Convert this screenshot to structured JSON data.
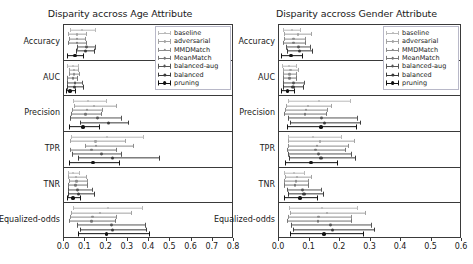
{
  "chart_data": {
    "type": "scatter",
    "layout": "2 panels side by side, each with 6 stacked metric sub-rows; horizontal point estimates with confidence-interval error bars",
    "panels": [
      {
        "id": "age",
        "title": "Disparity accross Age Attribute",
        "xlabel": "",
        "ylabel": "",
        "xlim": [
          0.0,
          0.8
        ],
        "xticks": [
          "0.0",
          "0.1",
          "0.2",
          "0.3",
          "0.4",
          "0.5",
          "0.6",
          "0.7",
          "0.8"
        ],
        "grid": false,
        "legend_position": "upper right",
        "metrics": [
          {
            "label": "Accuracy",
            "series": [
              {
                "name": "baseline",
                "value": 0.085,
                "low": 0.03,
                "high": 0.15
              },
              {
                "name": "adversarial",
                "value": 0.06,
                "low": 0.018,
                "high": 0.11
              },
              {
                "name": "MMDMatch",
                "value": 0.06,
                "low": 0.022,
                "high": 0.105
              },
              {
                "name": "MeanMatch",
                "value": 0.062,
                "low": 0.02,
                "high": 0.108
              },
              {
                "name": "balanced-aug",
                "value": 0.108,
                "low": 0.062,
                "high": 0.152
              },
              {
                "name": "balanced",
                "value": 0.103,
                "low": 0.058,
                "high": 0.148
              },
              {
                "name": "pruning",
                "value": 0.052,
                "low": 0.012,
                "high": 0.095
              }
            ]
          },
          {
            "label": "AUC",
            "series": [
              {
                "name": "baseline",
                "value": 0.04,
                "low": 0.015,
                "high": 0.07
              },
              {
                "name": "adversarial",
                "value": 0.046,
                "low": 0.022,
                "high": 0.072
              },
              {
                "name": "MMDMatch",
                "value": 0.048,
                "low": 0.024,
                "high": 0.074
              },
              {
                "name": "MeanMatch",
                "value": 0.042,
                "low": 0.016,
                "high": 0.068
              },
              {
                "name": "balanced-aug",
                "value": 0.052,
                "low": 0.014,
                "high": 0.09
              },
              {
                "name": "balanced",
                "value": 0.05,
                "low": 0.012,
                "high": 0.092
              },
              {
                "name": "pruning",
                "value": 0.03,
                "low": 0.01,
                "high": 0.058
              }
            ]
          },
          {
            "label": "Precision",
            "series": [
              {
                "name": "baseline",
                "value": 0.115,
                "low": 0.04,
                "high": 0.2
              },
              {
                "name": "adversarial",
                "value": 0.14,
                "low": 0.048,
                "high": 0.248
              },
              {
                "name": "MMDMatch",
                "value": 0.108,
                "low": 0.038,
                "high": 0.185
              },
              {
                "name": "MeanMatch",
                "value": 0.1,
                "low": 0.035,
                "high": 0.178
              },
              {
                "name": "balanced-aug",
                "value": 0.158,
                "low": 0.03,
                "high": 0.275
              },
              {
                "name": "balanced",
                "value": 0.208,
                "low": 0.075,
                "high": 0.305
              },
              {
                "name": "pruning",
                "value": 0.09,
                "low": 0.022,
                "high": 0.17
              }
            ]
          },
          {
            "label": "TPR",
            "series": [
              {
                "name": "baseline",
                "value": 0.2,
                "low": 0.035,
                "high": 0.375
              },
              {
                "name": "adversarial",
                "value": 0.148,
                "low": 0.03,
                "high": 0.29
              },
              {
                "name": "MMDMatch",
                "value": 0.15,
                "low": 0.1,
                "high": 0.33
              },
              {
                "name": "MeanMatch",
                "value": 0.13,
                "low": 0.028,
                "high": 0.25
              },
              {
                "name": "balanced-aug",
                "value": 0.178,
                "low": 0.038,
                "high": 0.272
              },
              {
                "name": "balanced",
                "value": 0.228,
                "low": 0.068,
                "high": 0.45
              },
              {
                "name": "pruning",
                "value": 0.135,
                "low": 0.025,
                "high": 0.262
              }
            ]
          },
          {
            "label": "TNR",
            "series": [
              {
                "name": "baseline",
                "value": 0.042,
                "low": 0.018,
                "high": 0.075
              },
              {
                "name": "adversarial",
                "value": 0.055,
                "low": 0.02,
                "high": 0.11
              },
              {
                "name": "MMDMatch",
                "value": 0.058,
                "low": 0.022,
                "high": 0.115
              },
              {
                "name": "MeanMatch",
                "value": 0.055,
                "low": 0.02,
                "high": 0.112
              },
              {
                "name": "balanced-aug",
                "value": 0.062,
                "low": 0.018,
                "high": 0.135
              },
              {
                "name": "balanced",
                "value": 0.07,
                "low": 0.02,
                "high": 0.148
              },
              {
                "name": "pruning",
                "value": 0.042,
                "low": 0.015,
                "high": 0.082
              }
            ]
          },
          {
            "label": "Equalized-odds",
            "series": [
              {
                "name": "baseline",
                "value": 0.205,
                "low": 0.04,
                "high": 0.37
              },
              {
                "name": "adversarial",
                "value": 0.17,
                "low": 0.032,
                "high": 0.318
              },
              {
                "name": "MMDMatch",
                "value": 0.135,
                "low": 0.028,
                "high": 0.25
              },
              {
                "name": "MeanMatch",
                "value": 0.13,
                "low": 0.025,
                "high": 0.245
              },
              {
                "name": "balanced-aug",
                "value": 0.222,
                "low": 0.06,
                "high": 0.385
              },
              {
                "name": "balanced",
                "value": 0.23,
                "low": 0.075,
                "high": 0.392
              },
              {
                "name": "pruning",
                "value": 0.2,
                "low": 0.068,
                "high": 0.405
              }
            ]
          }
        ]
      },
      {
        "id": "gender",
        "title": "Disparity accross Gender Attribute",
        "xlabel": "",
        "ylabel": "",
        "xlim": [
          0.0,
          0.6
        ],
        "xticks": [
          "0.0",
          "0.1",
          "0.2",
          "0.3",
          "0.4",
          "0.5",
          "0.6"
        ],
        "grid": false,
        "legend_position": "upper right",
        "metrics": [
          {
            "label": "Accuracy",
            "series": [
              {
                "name": "baseline",
                "value": 0.042,
                "low": 0.012,
                "high": 0.072
              },
              {
                "name": "adversarial",
                "value": 0.062,
                "low": 0.018,
                "high": 0.108
              },
              {
                "name": "MMDMatch",
                "value": 0.048,
                "low": 0.015,
                "high": 0.09
              },
              {
                "name": "MeanMatch",
                "value": 0.048,
                "low": 0.014,
                "high": 0.088
              },
              {
                "name": "balanced-aug",
                "value": 0.065,
                "low": 0.022,
                "high": 0.105
              },
              {
                "name": "balanced",
                "value": 0.068,
                "low": 0.025,
                "high": 0.11
              },
              {
                "name": "pruning",
                "value": 0.04,
                "low": 0.008,
                "high": 0.078
              }
            ]
          },
          {
            "label": "AUC",
            "series": [
              {
                "name": "baseline",
                "value": 0.032,
                "low": 0.01,
                "high": 0.058
              },
              {
                "name": "adversarial",
                "value": 0.038,
                "low": 0.014,
                "high": 0.065
              },
              {
                "name": "MMDMatch",
                "value": 0.035,
                "low": 0.012,
                "high": 0.06
              },
              {
                "name": "MeanMatch",
                "value": 0.034,
                "low": 0.012,
                "high": 0.058
              },
              {
                "name": "balanced-aug",
                "value": 0.048,
                "low": 0.012,
                "high": 0.085
              },
              {
                "name": "balanced",
                "value": 0.046,
                "low": 0.012,
                "high": 0.082
              },
              {
                "name": "pruning",
                "value": 0.028,
                "low": 0.008,
                "high": 0.052
              }
            ]
          },
          {
            "label": "Precision",
            "series": [
              {
                "name": "baseline",
                "value": 0.13,
                "low": 0.03,
                "high": 0.235
              },
              {
                "name": "adversarial",
                "value": 0.095,
                "low": 0.022,
                "high": 0.175
              },
              {
                "name": "MMDMatch",
                "value": 0.088,
                "low": 0.02,
                "high": 0.162
              },
              {
                "name": "MeanMatch",
                "value": 0.085,
                "low": 0.018,
                "high": 0.158
              },
              {
                "name": "balanced-aug",
                "value": 0.14,
                "low": 0.03,
                "high": 0.258
              },
              {
                "name": "balanced",
                "value": 0.148,
                "low": 0.035,
                "high": 0.268
              },
              {
                "name": "pruning",
                "value": 0.138,
                "low": 0.025,
                "high": 0.255
              }
            ]
          },
          {
            "label": "TPR",
            "series": [
              {
                "name": "baseline",
                "value": 0.112,
                "low": 0.028,
                "high": 0.205
              },
              {
                "name": "adversarial",
                "value": 0.135,
                "low": 0.03,
                "high": 0.25
              },
              {
                "name": "MMDMatch",
                "value": 0.125,
                "low": 0.028,
                "high": 0.228
              },
              {
                "name": "MeanMatch",
                "value": 0.12,
                "low": 0.025,
                "high": 0.22
              },
              {
                "name": "balanced-aug",
                "value": 0.13,
                "low": 0.03,
                "high": 0.24
              },
              {
                "name": "balanced",
                "value": 0.138,
                "low": 0.032,
                "high": 0.252
              },
              {
                "name": "pruning",
                "value": 0.105,
                "low": 0.02,
                "high": 0.192
              }
            ]
          },
          {
            "label": "TNR",
            "series": [
              {
                "name": "baseline",
                "value": 0.048,
                "low": 0.018,
                "high": 0.085
              },
              {
                "name": "adversarial",
                "value": 0.06,
                "low": 0.02,
                "high": 0.108
              },
              {
                "name": "MMDMatch",
                "value": 0.055,
                "low": 0.018,
                "high": 0.1
              },
              {
                "name": "MeanMatch",
                "value": 0.052,
                "low": 0.018,
                "high": 0.098
              },
              {
                "name": "balanced-aug",
                "value": 0.078,
                "low": 0.025,
                "high": 0.142
              },
              {
                "name": "balanced",
                "value": 0.082,
                "low": 0.028,
                "high": 0.148
              },
              {
                "name": "pruning",
                "value": 0.068,
                "low": 0.015,
                "high": 0.128
              }
            ]
          },
          {
            "label": "Equalized-odds",
            "series": [
              {
                "name": "baseline",
                "value": 0.14,
                "low": 0.032,
                "high": 0.258
              },
              {
                "name": "adversarial",
                "value": 0.158,
                "low": 0.035,
                "high": 0.285
              },
              {
                "name": "MMDMatch",
                "value": 0.13,
                "low": 0.028,
                "high": 0.24
              },
              {
                "name": "MeanMatch",
                "value": 0.128,
                "low": 0.026,
                "high": 0.238
              },
              {
                "name": "balanced-aug",
                "value": 0.168,
                "low": 0.04,
                "high": 0.305
              },
              {
                "name": "balanced",
                "value": 0.175,
                "low": 0.045,
                "high": 0.315
              },
              {
                "name": "pruning",
                "value": 0.148,
                "low": 0.035,
                "high": 0.28
              }
            ]
          }
        ]
      }
    ],
    "legend": [
      {
        "label": "baseline",
        "color": "#b9b9b9",
        "linewidth": 0.6,
        "markersize": 2.0
      },
      {
        "label": "adversarial",
        "color": "#a3a3a3",
        "linewidth": 0.7,
        "markersize": 2.2
      },
      {
        "label": "MMDMatch",
        "color": "#8c8c8c",
        "linewidth": 0.8,
        "markersize": 2.4
      },
      {
        "label": "MeanMatch",
        "color": "#757575",
        "linewidth": 0.9,
        "markersize": 2.6
      },
      {
        "label": "balanced-aug",
        "color": "#555555",
        "linewidth": 1.1,
        "markersize": 2.9
      },
      {
        "label": "balanced",
        "color": "#3a3a3a",
        "linewidth": 1.3,
        "markersize": 3.2
      },
      {
        "label": "pruning",
        "color": "#111111",
        "linewidth": 1.7,
        "markersize": 3.8
      }
    ]
  },
  "figure": {
    "background": "#ffffff",
    "axis_color": "#3a3a3a",
    "text_color": "#1a1a1a"
  }
}
